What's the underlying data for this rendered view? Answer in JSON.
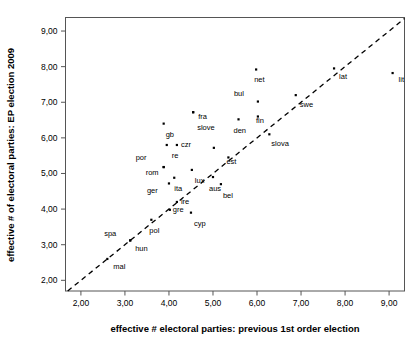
{
  "chart_data": {
    "type": "scatter",
    "title": "",
    "xlabel": "effective # electoral parties: previous 1st order election",
    "ylabel": "effective # of electoral parties: EP election 2009",
    "xlim": [
      1.65,
      9.35
    ],
    "ylim": [
      1.7,
      9.38
    ],
    "xticks": [
      "2,00",
      "3,00",
      "4,00",
      "5,00",
      "6,00",
      "7,00",
      "8,00",
      "9,00"
    ],
    "xtick_values": [
      2,
      3,
      4,
      5,
      6,
      7,
      8,
      9
    ],
    "yticks": [
      "2,00",
      "3,00",
      "4,00",
      "5,00",
      "6,00",
      "7,00",
      "8,00",
      "9,00"
    ],
    "ytick_values": [
      2,
      3,
      4,
      5,
      6,
      7,
      8,
      9
    ],
    "grid": false,
    "legend": "none",
    "reference_line": {
      "name": "identity-diagonal",
      "style": "dashed",
      "from": [
        1.7,
        1.7
      ],
      "to": [
        9.35,
        9.35
      ]
    },
    "points": [
      {
        "label": "mal",
        "x": 2.6,
        "y": 2.6,
        "label_dx": 6,
        "label_dy": 10
      },
      {
        "label": "hun",
        "x": 3.12,
        "y": 3.12,
        "label_dx": 5,
        "label_dy": 11
      },
      {
        "label": "spa",
        "x": 3.12,
        "y": 3.12,
        "label_dx": -26,
        "label_dy": -4
      },
      {
        "label": "pol",
        "x": 3.6,
        "y": 3.7,
        "label_dx": -2,
        "label_dy": 13
      },
      {
        "label": "gre",
        "x": 4.02,
        "y": 3.98,
        "label_dx": 3,
        "label_dy": 2
      },
      {
        "label": "ire",
        "x": 4.18,
        "y": 4.2,
        "label_dx": 4,
        "label_dy": 2
      },
      {
        "label": "cyp",
        "x": 4.5,
        "y": 3.9,
        "label_dx": 3,
        "label_dy": 13
      },
      {
        "label": "ger",
        "x": 4.0,
        "y": 4.72,
        "label_dx": -22,
        "label_dy": 10
      },
      {
        "label": "ita",
        "x": 4.12,
        "y": 4.88,
        "label_dx": 0,
        "label_dy": 13
      },
      {
        "label": "rom",
        "x": 3.88,
        "y": 5.18,
        "label_dx": -18,
        "label_dy": 8
      },
      {
        "label": "por",
        "x": 3.88,
        "y": 5.18,
        "label_dx": -28,
        "label_dy": -7
      },
      {
        "label": "lux",
        "x": 4.52,
        "y": 5.1,
        "label_dx": 3,
        "label_dy": 13
      },
      {
        "label": "aus",
        "x": 5.0,
        "y": 4.9,
        "label_dx": -4,
        "label_dy": 14
      },
      {
        "label": "bel",
        "x": 5.18,
        "y": 4.7,
        "label_dx": 2,
        "label_dy": 14
      },
      {
        "label": "est",
        "x": 5.35,
        "y": 5.45,
        "label_dx": -2,
        "label_dy": 7
      },
      {
        "label": "ire2",
        "x": 5.02,
        "y": 5.72,
        "label_dx": 0,
        "label_dy": 0
      },
      {
        "label": "re",
        "x": 3.95,
        "y": 5.8,
        "label_dx": 5,
        "label_dy": 13
      },
      {
        "label": "czr",
        "x": 4.18,
        "y": 5.8,
        "label_dx": 4,
        "label_dy": 2
      },
      {
        "label": "gb",
        "x": 3.88,
        "y": 6.4,
        "label_dx": 2,
        "label_dy": 13
      },
      {
        "label": "slove",
        "x": 4.55,
        "y": 6.72,
        "label_dx": 4,
        "label_dy": 18
      },
      {
        "label": "fra",
        "x": 4.55,
        "y": 6.72,
        "label_dx": 5,
        "label_dy": 7
      },
      {
        "label": "den",
        "x": 5.58,
        "y": 6.52,
        "label_dx": -5,
        "label_dy": 14
      },
      {
        "label": "fin",
        "x": 6.02,
        "y": 6.6,
        "label_dx": -2,
        "label_dy": 6
      },
      {
        "label": "slova",
        "x": 6.28,
        "y": 6.1,
        "label_dx": 2,
        "label_dy": 12
      },
      {
        "label": "bul",
        "x": 6.02,
        "y": 7.02,
        "label_dx": -24,
        "label_dy": -6
      },
      {
        "label": "net",
        "x": 5.98,
        "y": 7.92,
        "label_dx": -2,
        "label_dy": 13
      },
      {
        "label": "swe",
        "x": 6.88,
        "y": 7.2,
        "label_dx": 4,
        "label_dy": 12
      },
      {
        "label": "lat",
        "x": 7.75,
        "y": 7.95,
        "label_dx": 5,
        "label_dy": 11
      },
      {
        "label": "lit",
        "x": 9.08,
        "y": 7.82,
        "label_dx": 6,
        "label_dy": 9
      }
    ]
  },
  "axes": {
    "x_title": "effective # electoral parties: previous 1st order election",
    "y_title": "effective # of electoral parties: EP election 2009"
  },
  "colors": {
    "marker": "#000000",
    "frame": "#555555",
    "diagonal": "#000000",
    "background": "#ffffff"
  }
}
